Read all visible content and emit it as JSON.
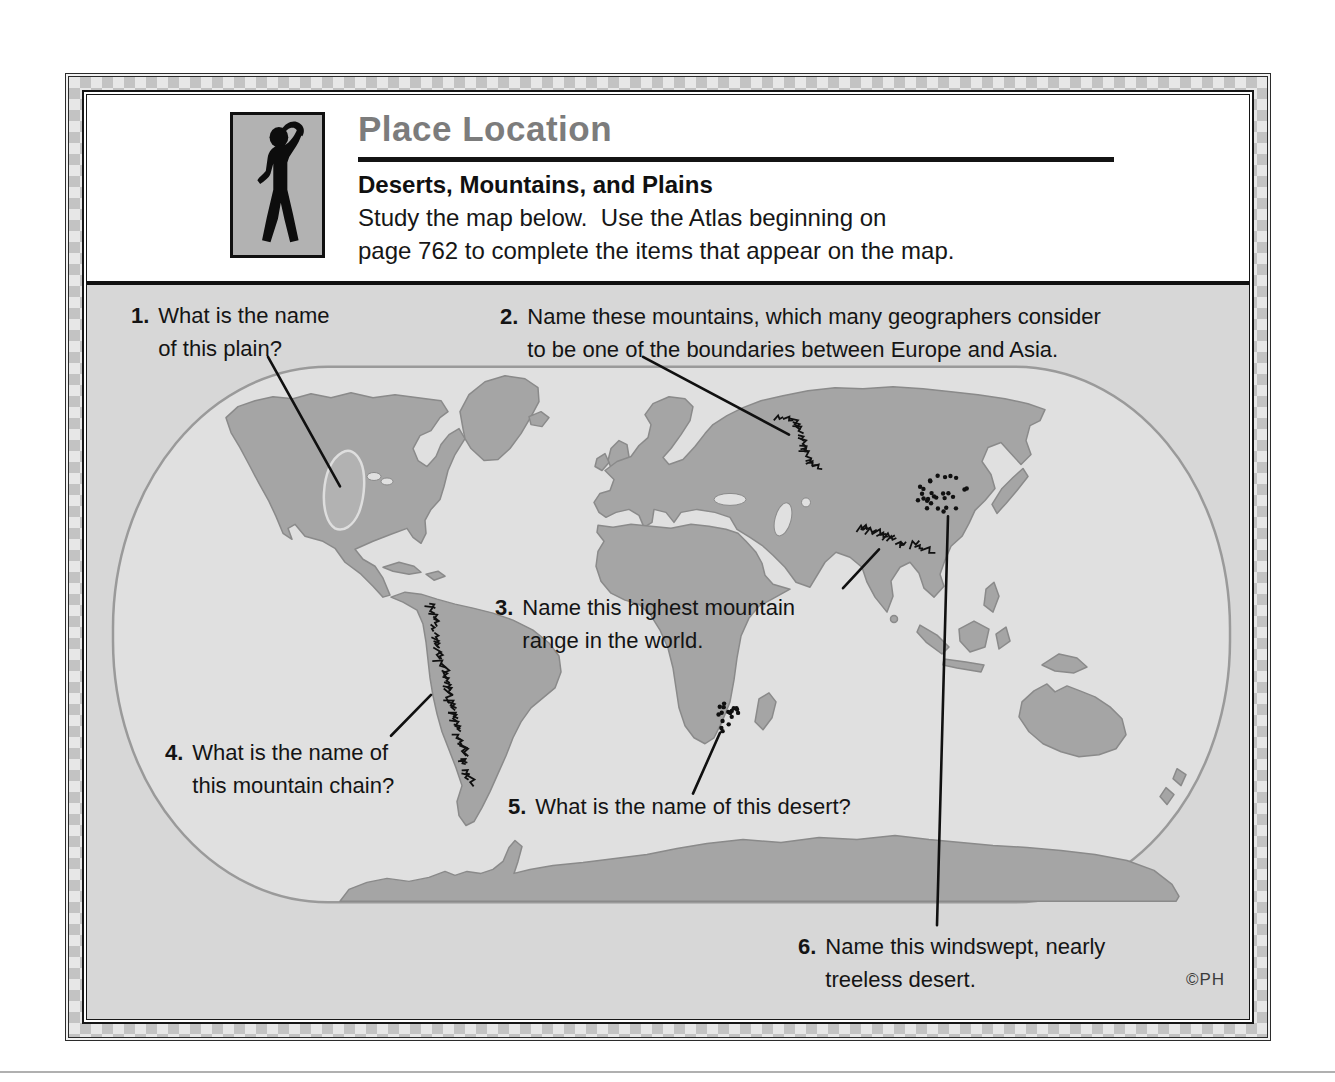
{
  "header": {
    "title": "Place Location",
    "subtitle": "Deserts, Mountains, and Plains",
    "instructions_line1": "Study the map below.  Use the Atlas beginning on",
    "instructions_line2": "page 762 to complete the items that appear on the map."
  },
  "questions": [
    {
      "num": "1.",
      "lines": [
        "What is the name",
        "of this plain?"
      ]
    },
    {
      "num": "2.",
      "lines": [
        "Name these mountains, which many geographers consider",
        "to be one of the boundaries between Europe and Asia."
      ]
    },
    {
      "num": "3.",
      "lines": [
        "Name this highest mountain",
        "range in the world."
      ]
    },
    {
      "num": "4.",
      "lines": [
        "What is the name of",
        "this mountain chain?"
      ]
    },
    {
      "num": "5.",
      "lines": [
        "What is the name of this desert?"
      ]
    },
    {
      "num": "6.",
      "lines": [
        "Name this windswept, nearly",
        "treeless desert."
      ]
    }
  ],
  "credit": "©PH",
  "colors": {
    "title_gray": "#7c7c7c",
    "land_gray": "#a5a5a5",
    "ocean_gray": "#e0e0e0",
    "ink": "#101010"
  },
  "map": {
    "leader_lines": [
      {
        "name": "leader-to-great-plains",
        "from": [
          275,
          360
        ],
        "to": [
          347,
          490
        ]
      },
      {
        "name": "leader-to-ural-mountains",
        "from": [
          650,
          360
        ],
        "to": [
          796,
          438
        ]
      },
      {
        "name": "leader-to-himalayas",
        "from": [
          850,
          592
        ],
        "to": [
          886,
          553
        ]
      },
      {
        "name": "leader-to-andes",
        "from": [
          398,
          740
        ],
        "to": [
          438,
          699
        ]
      },
      {
        "name": "leader-to-kalahari",
        "from": [
          700,
          798
        ],
        "to": [
          727,
          737
        ]
      },
      {
        "name": "leader-to-gobi",
        "from": [
          955,
          520
        ],
        "to": [
          944,
          930
        ]
      }
    ],
    "mountain_chains": [
      {
        "name": "ural-mountains",
        "points": [
          [
            788,
            420
          ],
          [
            800,
            426
          ],
          [
            806,
            440
          ],
          [
            810,
            455
          ],
          [
            818,
            468
          ],
          [
            826,
            479
          ]
        ]
      },
      {
        "name": "himalaya-mountains",
        "points": [
          [
            868,
            531
          ],
          [
            884,
            538
          ],
          [
            898,
            544
          ],
          [
            912,
            549
          ],
          [
            926,
            551
          ],
          [
            940,
            556
          ]
        ]
      },
      {
        "name": "andes-mountains",
        "points": [
          [
            438,
            611
          ],
          [
            441,
            632
          ],
          [
            446,
            656
          ],
          [
            450,
            679
          ],
          [
            455,
            701
          ],
          [
            460,
            723
          ],
          [
            466,
            746
          ],
          [
            471,
            769
          ],
          [
            476,
            791
          ]
        ]
      }
    ],
    "dot_fields": [
      {
        "name": "gobi-desert-dots",
        "cx": 948,
        "cy": 497,
        "rx": 27,
        "ry": 19,
        "count": 28
      },
      {
        "name": "kalahari-desert-dots",
        "cx": 734,
        "cy": 721,
        "rx": 13,
        "ry": 16,
        "count": 17
      }
    ]
  }
}
